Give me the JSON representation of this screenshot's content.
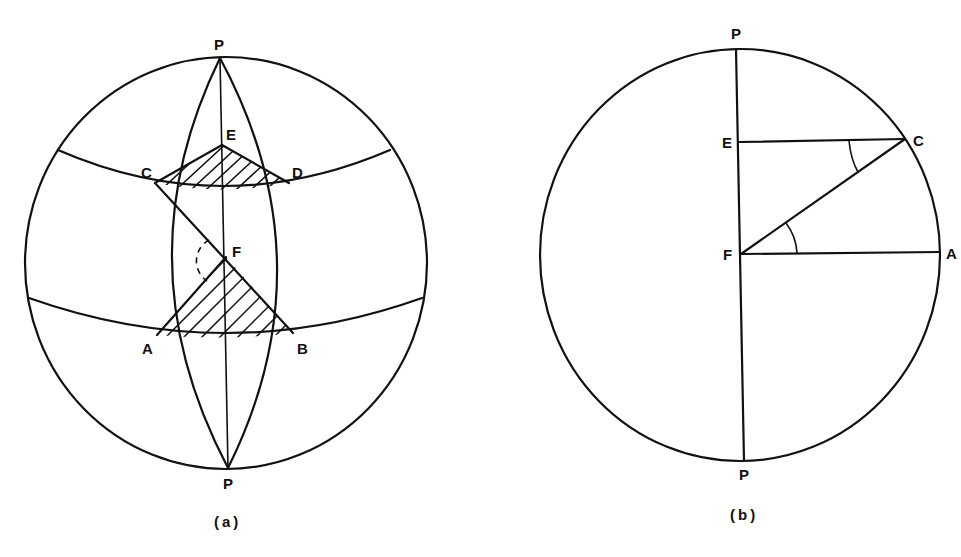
{
  "figure_a": {
    "caption": "(a)",
    "labels": {
      "p_top": "P",
      "p_bottom": "P",
      "e": "E",
      "c": "C",
      "d": "D",
      "f": "F",
      "a": "A",
      "b": "B"
    },
    "description": "Sphere with two poles P, two meridians forming a lens, two parallels of latitude, hatched spherical triangles ECD and FAB, line CFB with dashed angle arc at F"
  },
  "figure_b": {
    "caption": "(b)",
    "labels": {
      "p_top": "P",
      "p_bottom": "P",
      "e": "E",
      "c": "C",
      "f": "F",
      "a": "A"
    },
    "description": "Circle cross-section with polar axis PP, horizontal chords EC and FA, radius FC, and equal angles marked at C and F"
  },
  "colors": {
    "ink": "#111111",
    "paper": "#ffffff"
  }
}
